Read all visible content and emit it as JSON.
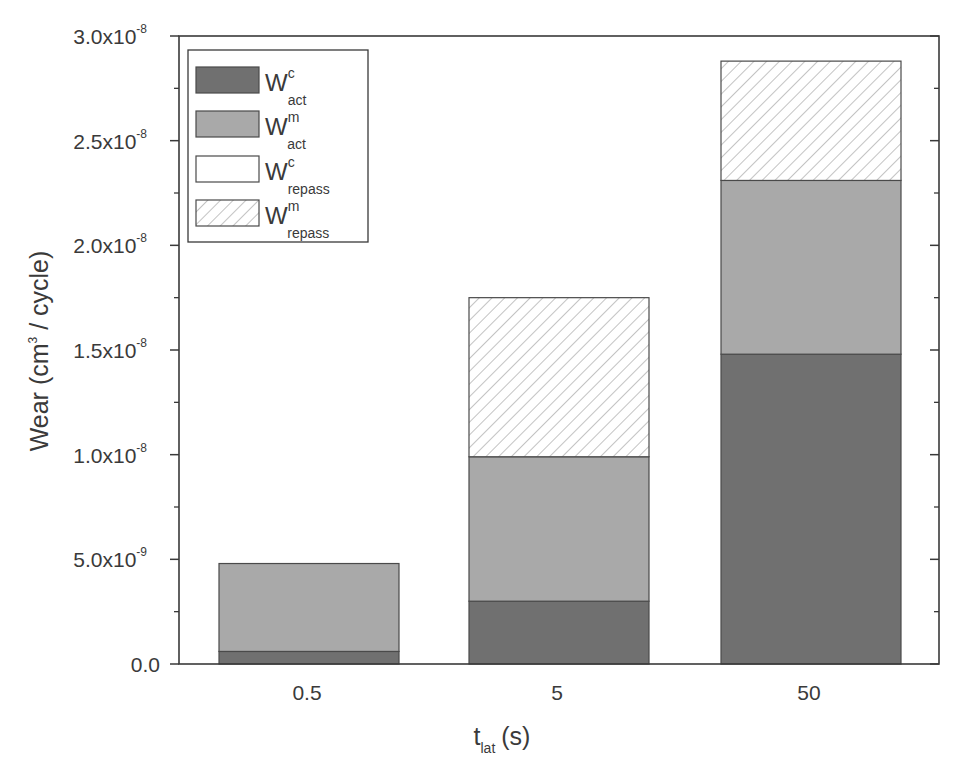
{
  "chart_data": {
    "type": "bar",
    "stacked": true,
    "title": "",
    "xlabel": "t_lat (s)",
    "xlabel_main": "t",
    "xlabel_sub": "lat",
    "xlabel_unit": "(s)",
    "ylabel": "Wear (cm^3 / cycle)",
    "ylabel_pre": "Wear (cm",
    "ylabel_sup": "3",
    "ylabel_post": " / cycle)",
    "ylim": [
      0,
      3e-08
    ],
    "yticks": [
      {
        "value": 0,
        "mantissa": "0.0",
        "exp": ""
      },
      {
        "value": 5e-09,
        "mantissa": "5.0x10",
        "exp": "-9"
      },
      {
        "value": 1e-08,
        "mantissa": "1.0x10",
        "exp": "-8"
      },
      {
        "value": 1.5e-08,
        "mantissa": "1.5x10",
        "exp": "-8"
      },
      {
        "value": 2e-08,
        "mantissa": "2.0x10",
        "exp": "-8"
      },
      {
        "value": 2.5e-08,
        "mantissa": "2.5x10",
        "exp": "-8"
      },
      {
        "value": 3e-08,
        "mantissa": "3.0x10",
        "exp": "-8"
      }
    ],
    "grid": false,
    "legend_position": "upper-left",
    "categories": [
      "0.5",
      "5",
      "50"
    ],
    "series": [
      {
        "name": "W^c_act",
        "main": "W",
        "sup": "c",
        "sub": "act",
        "fill": "#707070",
        "pattern": "solid",
        "values": [
          6e-10,
          3e-09,
          1.48e-08
        ]
      },
      {
        "name": "W^m_act",
        "main": "W",
        "sup": "m",
        "sub": "act",
        "fill": "#a9a9a9",
        "pattern": "solid",
        "values": [
          4.2e-09,
          6.9e-09,
          8.3e-09
        ]
      },
      {
        "name": "W^c_repass",
        "main": "W",
        "sup": "c",
        "sub": "repass",
        "fill": "#ffffff",
        "pattern": "solid",
        "values": [
          0,
          0,
          0
        ]
      },
      {
        "name": "W^m_repass",
        "main": "W",
        "sup": "m",
        "sub": "repass",
        "fill": "#ffffff",
        "pattern": "hatch",
        "values": [
          0,
          7.6e-09,
          5.7e-09
        ]
      }
    ],
    "totals": [
      4.8e-09,
      1.75e-08,
      2.88e-08
    ]
  },
  "colors": {
    "axis": "#3a3a3a",
    "dark_bar": "#707070",
    "medium_bar": "#a9a9a9",
    "hatch_line": "#9a9a9a",
    "background": "#ffffff"
  }
}
